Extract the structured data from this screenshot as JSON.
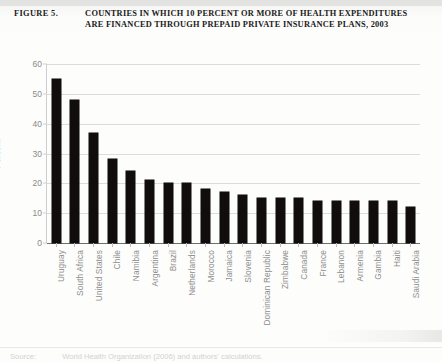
{
  "figure": {
    "label": "FIGURE 5.",
    "title": "COUNTRIES IN WHICH 10 PERCENT OR MORE OF HEALTH EXPENDITURES ARE FINANCED THROUGH PREPAID PRIVATE INSURANCE PLANS, 2003"
  },
  "source": {
    "key": "Source:",
    "value": "World Health Organization (2006) and authors' calculations."
  },
  "colors": {
    "bar": "#100d0c",
    "grid": "#dcdcdc",
    "axis_text": "#8a8a8a",
    "title_text": "#1b1b1b"
  },
  "chart_data": {
    "type": "bar",
    "title": "COUNTRIES IN WHICH 10 PERCENT OR MORE OF HEALTH EXPENDITURES ARE FINANCED THROUGH PREPAID PRIVATE INSURANCE PLANS, 2003",
    "xlabel": "",
    "ylabel": "Percent",
    "ylim": [
      0,
      60
    ],
    "yticks": [
      0,
      10,
      20,
      30,
      40,
      50,
      60
    ],
    "grid": true,
    "legend": false,
    "categories": [
      "Uruguay",
      "South Africa",
      "United States",
      "Chile",
      "Namibia",
      "Argentina",
      "Brazil",
      "Netherlands",
      "Morocco",
      "Jamaica",
      "Slovenia",
      "Dominican Republic",
      "Zimbabwe",
      "Canada",
      "France",
      "Lebanon",
      "Armenia",
      "Gambia",
      "Haiti",
      "Saudi Arabia"
    ],
    "values": [
      55,
      48,
      37,
      28,
      24,
      21,
      20,
      20,
      18,
      17,
      16,
      15,
      15,
      15,
      14,
      14,
      14,
      14,
      14,
      12
    ]
  }
}
